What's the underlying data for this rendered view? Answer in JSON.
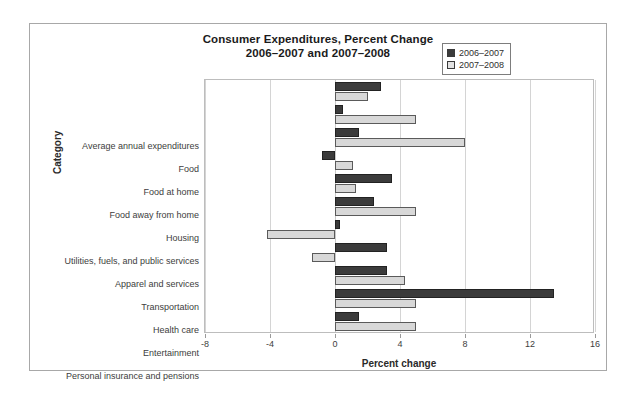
{
  "figure": {
    "title_line1": "Consumer Expenditures, Percent Change",
    "title_line2": "2006–2007 and 2007–2008"
  },
  "legend": {
    "position": "top-right",
    "entries": [
      {
        "label": "2006–2007",
        "color": "#3b3b3b"
      },
      {
        "label": "2007–2008",
        "color": "#e2e2e2"
      }
    ]
  },
  "chart_data": {
    "type": "bar",
    "orientation": "horizontal",
    "title": "Consumer Expenditures, Percent Change 2006–2007 and 2007–2008",
    "xlabel": "Percent change",
    "ylabel": "Category",
    "xlim": [
      -8,
      16
    ],
    "xticks": [
      -8,
      -4,
      0,
      4,
      8,
      12,
      16
    ],
    "xticklabels": [
      "-8",
      "-4",
      "0",
      "4",
      "8",
      "12",
      "16"
    ],
    "grid": true,
    "categories": [
      "Average annual expenditures",
      "Food",
      "Food at home",
      "Food away from home",
      "Housing",
      "Utilities, fuels, and public services",
      "Apparel and services",
      "Transportation",
      "Health care",
      "Entertainment",
      "Personal insurance and pensions"
    ],
    "series": [
      {
        "name": "2006–2007",
        "color": "#3b3b3b",
        "values": [
          2.8,
          0.5,
          1.5,
          -0.8,
          3.5,
          2.4,
          0.3,
          3.2,
          3.2,
          13.5,
          1.5
        ]
      },
      {
        "name": "2007–2008",
        "color": "#e2e2e2",
        "values": [
          2.0,
          5.0,
          8.0,
          1.1,
          1.3,
          5.0,
          -4.2,
          -1.4,
          4.3,
          5.0,
          5.0
        ]
      }
    ]
  }
}
